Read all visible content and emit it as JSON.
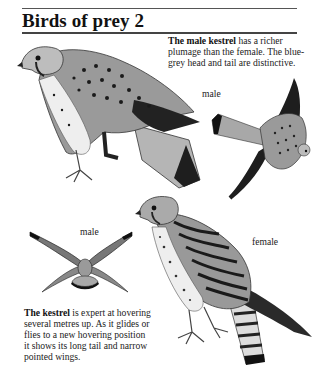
{
  "page": {
    "title": "Birds of prey 2"
  },
  "captions": {
    "top": {
      "lead": "The male kestrel",
      "rest": " has a richer plumage than the female. The blue-grey head and tail are distinctive."
    },
    "bottom": {
      "lead": "The kestrel",
      "rest": " is expert at hovering several metres up. As it glides or flies to a new hovering position it shows its long tail and narrow pointed wings."
    }
  },
  "labels": {
    "flying_male": "male",
    "hovering_male": "male",
    "perched_female": "female"
  },
  "illustrations": [
    {
      "name": "perched-male-kestrel",
      "description": "male kestrel perched, side view"
    },
    {
      "name": "flying-male-kestrel",
      "description": "male kestrel in flight, seen from below"
    },
    {
      "name": "hovering-male-kestrel",
      "description": "male kestrel hovering, seen from behind"
    },
    {
      "name": "perched-female-kestrel",
      "description": "female kestrel perched, barred plumage"
    }
  ],
  "colors": {
    "ink": "#1a1a1a",
    "grey_tail": "#a8a8a8",
    "plumage_mid": "#8a8a8a",
    "background": "#ffffff"
  }
}
